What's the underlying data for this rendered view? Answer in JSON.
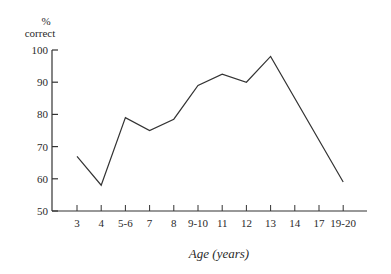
{
  "chart_data": {
    "type": "line",
    "title": "",
    "ylabel_line1": "%",
    "ylabel_line2": "correct",
    "xlabel": "Age (years)",
    "categories": [
      "3",
      "4",
      "5-6",
      "7",
      "8",
      "9-10",
      "11",
      "12",
      "13",
      "14",
      "17",
      "19-20"
    ],
    "series": [
      {
        "name": "% correct",
        "points": [
          {
            "x": "3",
            "y": 67
          },
          {
            "x": "4",
            "y": 58
          },
          {
            "x": "5-6",
            "y": 79
          },
          {
            "x": "7",
            "y": 75
          },
          {
            "x": "8",
            "y": 78.5
          },
          {
            "x": "9-10",
            "y": 89
          },
          {
            "x": "11",
            "y": 92.5
          },
          {
            "x": "12",
            "y": 90
          },
          {
            "x": "13",
            "y": 98
          },
          {
            "x": "19-20",
            "y": 59
          }
        ]
      }
    ],
    "yticks": [
      50,
      60,
      70,
      80,
      90,
      100
    ],
    "ylim": [
      50,
      100
    ],
    "grid": false,
    "legend": null
  }
}
